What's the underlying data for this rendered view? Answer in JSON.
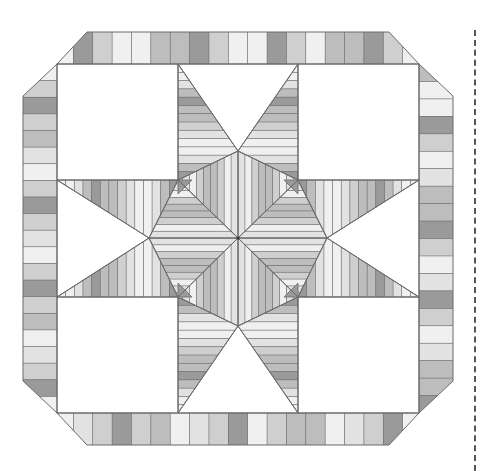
{
  "diagram": {
    "type": "quilt-block-pattern",
    "palette": {
      "outline": "#6b6b6b",
      "white": "#ffffff",
      "tones": [
        "#f0f0f0",
        "#e2e2e2",
        "#cfcfcf",
        "#bdbdbd",
        "#9a9a9a"
      ]
    },
    "border": {
      "outer": {
        "left": 23,
        "top": 32,
        "right": 453,
        "bottom": 445,
        "corner_cut": 64
      },
      "inner": {
        "left": 57,
        "top": 64,
        "right": 419,
        "bottom": 413
      },
      "top_stripes": [
        0,
        4,
        2,
        0,
        0,
        3,
        3,
        4,
        2,
        0,
        0,
        4,
        2,
        0,
        3,
        3,
        4,
        2,
        0
      ],
      "bottom_stripes": [
        0,
        1,
        2,
        4,
        2,
        3,
        0,
        1,
        2,
        4,
        0,
        2,
        3,
        3,
        0,
        1,
        2,
        4,
        0
      ],
      "left_stripes": [
        0,
        2,
        4,
        2,
        3,
        1,
        0,
        2,
        4,
        2,
        1,
        0,
        2,
        4,
        2,
        3,
        0,
        1,
        2,
        4,
        0
      ],
      "right_stripes": [
        3,
        0,
        0,
        4,
        2,
        0,
        1,
        3,
        3,
        4,
        2,
        0,
        1,
        4,
        2,
        0,
        1,
        3,
        3,
        4
      ]
    },
    "field": {
      "grid_x": [
        57,
        178,
        298,
        419
      ],
      "grid_y": [
        64,
        180,
        297,
        413
      ],
      "center": [
        238,
        238
      ],
      "star_point_stripes": [
        0,
        0,
        1,
        3,
        4,
        3,
        3,
        2,
        1,
        0,
        0,
        1,
        3,
        4
      ],
      "center_stripes": [
        4,
        3,
        1,
        0,
        0,
        1,
        0,
        2,
        3,
        3,
        2,
        0,
        1
      ]
    },
    "cut_line": {
      "style": "dashed",
      "x": 475
    }
  }
}
